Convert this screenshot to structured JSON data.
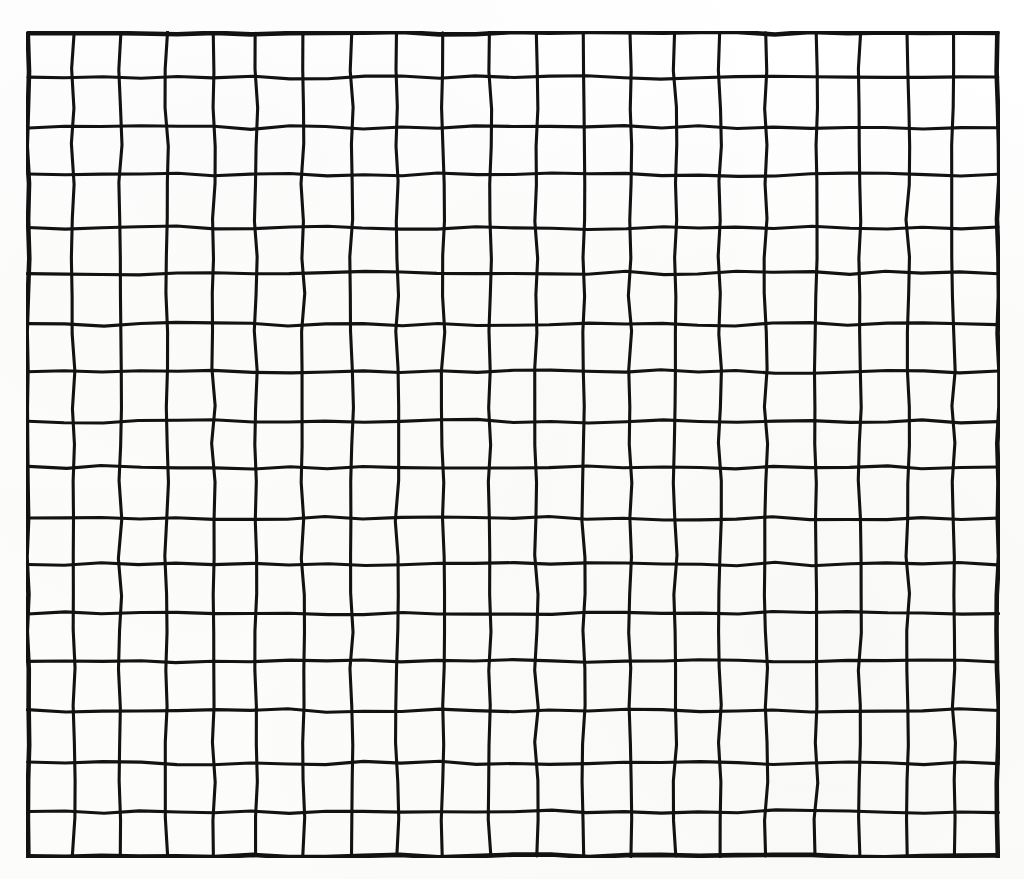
{
  "document": {
    "type": "scanned-grid-worksheet",
    "title": "Blank Grid Sheet",
    "background_color": "#fefefe",
    "ink_color": "#121212"
  },
  "figure": {
    "name": "grid",
    "columns": 21,
    "rows": 17,
    "cell_count": 357,
    "all_cells_empty": true,
    "border_style": "heavy",
    "line_style": "hand-drawn",
    "geometry": {
      "left": 26,
      "top": 31,
      "width": 974,
      "height": 827,
      "cell_width": 46.38,
      "cell_height": 48.65
    }
  },
  "chart_data": {
    "type": "table",
    "title": "",
    "columns": 21,
    "rows": 17,
    "column_headers": [],
    "row_headers": [],
    "cells": []
  },
  "labels": {
    "none_present": "",
    "annotations": []
  }
}
